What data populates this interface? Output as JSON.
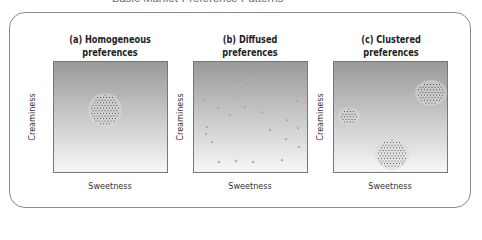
{
  "figure": {
    "title": "Basic Market-Preference Patterns"
  },
  "colors": {
    "gradient_top": "#9a9a9a",
    "gradient_bottom": "#f7f7f7",
    "dot": "#3a3a3a",
    "frame": "#8a8a8a"
  },
  "panels": [
    {
      "title_line1": "(a) Homogeneous",
      "title_line2": "preferences",
      "xlabel": "Sweetness",
      "ylabel": "Creaminess",
      "pattern": "homogeneous",
      "clusters": [
        {
          "cx": 51,
          "cy": 48,
          "rx": 15,
          "ry": 15
        }
      ]
    },
    {
      "title_line1": "(b) Diffused",
      "title_line2": "preferences",
      "xlabel": "Sweetness",
      "ylabel": "Creaminess",
      "pattern": "diffused",
      "points": [
        [
          13,
          23
        ],
        [
          47,
          25
        ],
        [
          56,
          19
        ],
        [
          97,
          23
        ],
        [
          10,
          38
        ],
        [
          44,
          36
        ],
        [
          103,
          39
        ],
        [
          24,
          46
        ],
        [
          51,
          45
        ],
        [
          68,
          50
        ],
        [
          36,
          53
        ],
        [
          93,
          58
        ],
        [
          13,
          65
        ],
        [
          104,
          66
        ],
        [
          76,
          68
        ],
        [
          12,
          72
        ],
        [
          92,
          77
        ],
        [
          18,
          80
        ],
        [
          105,
          85
        ],
        [
          25,
          100
        ],
        [
          42,
          99
        ],
        [
          59,
          100
        ],
        [
          88,
          98
        ]
      ]
    },
    {
      "title_line1": "(c) Clustered",
      "title_line2": "preferences",
      "xlabel": "Sweetness",
      "ylabel": "Creaminess",
      "pattern": "clustered",
      "clusters": [
        {
          "cx": 97,
          "cy": 31,
          "rx": 14,
          "ry": 11
        },
        {
          "cx": 15,
          "cy": 54,
          "rx": 9,
          "ry": 7
        },
        {
          "cx": 58,
          "cy": 92,
          "rx": 15,
          "ry": 14
        }
      ]
    }
  ]
}
